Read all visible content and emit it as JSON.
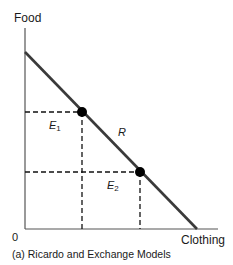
{
  "diagram": {
    "y_axis_label": "Food",
    "x_axis_label": "Clothing",
    "origin_label": "0",
    "curve_label": "R",
    "points": [
      {
        "name": "E",
        "subscript": "1"
      },
      {
        "name": "E",
        "subscript": "2"
      }
    ],
    "caption": "(a) Ricardo and Exchange Models"
  }
}
